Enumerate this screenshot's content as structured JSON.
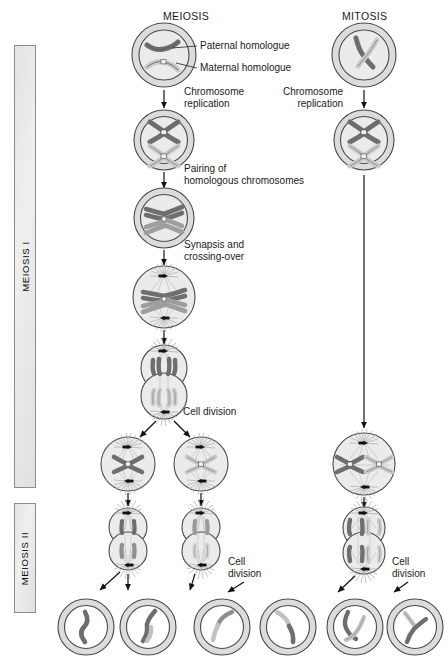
{
  "figure": {
    "title_meiosis": "MEIOSIS",
    "title_mitosis": "MITOSIS",
    "phase_bars": [
      {
        "label": "MEIOSIS I"
      },
      {
        "label": "MEIOSIS II"
      }
    ],
    "callouts": [
      {
        "id": "paternal",
        "text": "Paternal homologue"
      },
      {
        "id": "maternal",
        "text": "Maternal homologue"
      }
    ],
    "step_labels": [
      {
        "id": "meiosis-replication",
        "text": "Chromosome\nreplication"
      },
      {
        "id": "mitosis-replication",
        "text": "Chromosome\nreplication"
      },
      {
        "id": "pairing",
        "text": "Pairing of\nhomologous chromosomes"
      },
      {
        "id": "synapsis",
        "text": "Synapsis and\ncrossing-over"
      },
      {
        "id": "meiosis-i-division",
        "text": "Cell division"
      },
      {
        "id": "meiosis-ii-division",
        "text": "Cell\ndivision"
      },
      {
        "id": "mitosis-division",
        "text": "Cell\ndivision"
      }
    ],
    "colors": {
      "paternal_chromosome": "#6e6e6e",
      "maternal_chromosome": "#c9c9c9",
      "cytoplasm": "#ebebeb",
      "membrane_outer": "#dcdcdc",
      "outline": "#4a4a4a",
      "bar_fill": "#e6e6e6",
      "bar_border": "#8c8c8c",
      "arrow": "#111111",
      "spindle": "#b8b8b8",
      "centrosome": "#111111"
    }
  }
}
